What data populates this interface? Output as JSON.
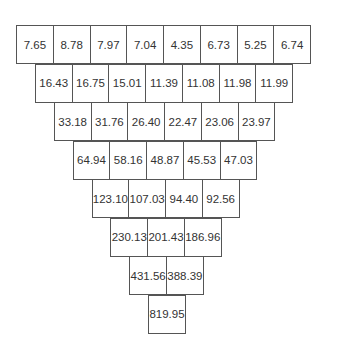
{
  "diagram": {
    "type": "inverted-pyramid",
    "rows": [
      [
        "7.65",
        "8.78",
        "7.97",
        "7.04",
        "4.35",
        "6.73",
        "5.25",
        "6.74"
      ],
      [
        "16.43",
        "16.75",
        "15.01",
        "11.39",
        "11.08",
        "11.98",
        "11.99"
      ],
      [
        "33.18",
        "31.76",
        "26.40",
        "22.47",
        "23.06",
        "23.97"
      ],
      [
        "64.94",
        "58.16",
        "48.87",
        "45.53",
        "47.03"
      ],
      [
        "123.10",
        "107.03",
        "94.40",
        "92.56"
      ],
      [
        "230.13",
        "201.43",
        "186.96"
      ],
      [
        "431.56",
        "388.39"
      ],
      [
        "819.95"
      ]
    ]
  },
  "colors": {
    "border": "#555555",
    "text": "#333333",
    "background": "#ffffff"
  }
}
